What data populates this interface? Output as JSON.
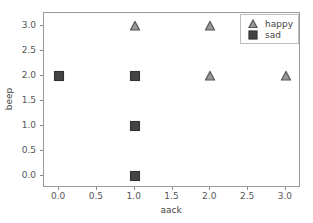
{
  "chart_data": {
    "type": "scatter",
    "title": "",
    "xlabel": "aack",
    "ylabel": "beep",
    "xlim": [
      -0.2,
      3.2
    ],
    "ylim": [
      -0.25,
      3.25
    ],
    "xticks": [
      "0.0",
      "0.5",
      "1.0",
      "1.5",
      "2.0",
      "2.5",
      "3.0"
    ],
    "xtick_values": [
      0.0,
      0.5,
      1.0,
      1.5,
      2.0,
      2.5,
      3.0
    ],
    "yticks": [
      "0.0",
      "0.5",
      "1.0",
      "1.5",
      "2.0",
      "2.5",
      "3.0"
    ],
    "ytick_values": [
      0.0,
      0.5,
      1.0,
      1.5,
      2.0,
      2.5,
      3.0
    ],
    "grid": false,
    "legend_position": "upper right",
    "series": [
      {
        "name": "happy",
        "marker": "triangle-up",
        "facecolor": "#999999",
        "edgecolor": "#555555",
        "points": [
          {
            "x": 1.0,
            "y": 3.0
          },
          {
            "x": 2.0,
            "y": 3.0
          },
          {
            "x": 2.0,
            "y": 2.0
          },
          {
            "x": 3.0,
            "y": 2.0
          }
        ]
      },
      {
        "name": "sad",
        "marker": "square",
        "facecolor": "#444444",
        "edgecolor": "#333333",
        "points": [
          {
            "x": 0.0,
            "y": 2.0
          },
          {
            "x": 1.0,
            "y": 2.0
          },
          {
            "x": 1.0,
            "y": 1.0
          },
          {
            "x": 1.0,
            "y": 0.0
          }
        ]
      }
    ]
  },
  "legend": {
    "entries": [
      {
        "label": "happy",
        "marker": "triangle-up"
      },
      {
        "label": "sad",
        "marker": "square"
      }
    ]
  },
  "colors": {
    "axis": "#999999",
    "tick": "#8a8a8a",
    "text": "#444444",
    "background": "#ffffff",
    "happy_fill": "#999999",
    "happy_edge": "#555555",
    "sad_fill": "#444444",
    "sad_edge": "#333333"
  }
}
